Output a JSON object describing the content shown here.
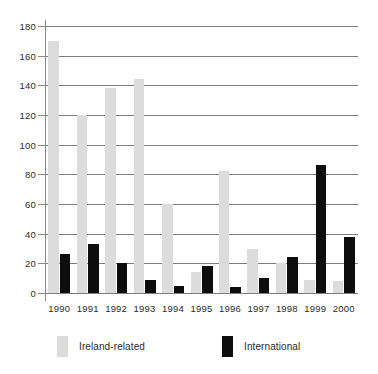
{
  "chart_data": {
    "type": "bar",
    "title": "",
    "subtitle": "",
    "xlabel": "",
    "ylabel": "",
    "categories": [
      "1990",
      "1991",
      "1992",
      "1993",
      "1994",
      "1995",
      "1996",
      "1997",
      "1998",
      "1999",
      "2000"
    ],
    "series": [
      {
        "name": "Ireland-related",
        "color": "#dcdcdc",
        "values": [
          170,
          120,
          138,
          144,
          60,
          14,
          82,
          30,
          20,
          9,
          8
        ]
      },
      {
        "name": "International",
        "color": "#0d0d0d",
        "values": [
          26,
          33,
          20,
          9,
          5,
          18,
          4,
          10,
          24,
          86,
          38
        ]
      }
    ],
    "ylim": [
      0,
      180
    ],
    "yticks": [
      0,
      20,
      40,
      60,
      80,
      100,
      120,
      140,
      160,
      180
    ],
    "ytick_labels": [
      "0",
      "20",
      "40",
      "60",
      "80",
      "100",
      "120",
      "140",
      "160",
      "180"
    ],
    "grid": true,
    "grid_axis": "y",
    "legend_position": "bottom",
    "legend": [
      "Ireland-related",
      "International"
    ]
  }
}
